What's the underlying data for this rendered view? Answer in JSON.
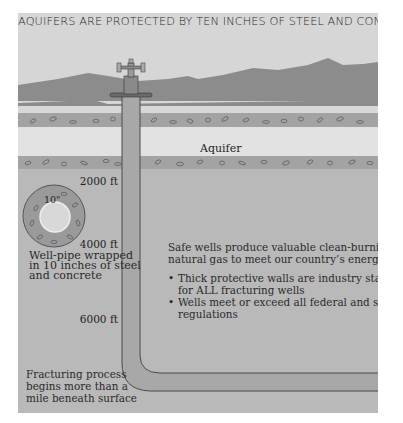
{
  "title": "AQUIFERS ARE PROTECTED BY TEN INCHES OF STEEL AND CONCRETE",
  "layers": {
    "aquifer_label": "Aquifer"
  },
  "depth_markers": [
    "2000 ft",
    "4000 ft",
    "6000 ft"
  ],
  "cross_section": {
    "thickness_label": "10\"",
    "caption": [
      "Well-pipe wrapped",
      "in 10 inches of steel",
      "and concrete"
    ]
  },
  "main_text": {
    "intro": [
      "Safe wells produce valuable clean-burning",
      "natural gas to meet our country’s energy needs"
    ],
    "bullets": [
      [
        "Thick protective walls are industry standard",
        "for ALL fracturing wells"
      ],
      [
        "Wells meet or exceed all federal and state",
        "regulations"
      ]
    ]
  },
  "footer_note": [
    "Fracturing process",
    "begins more than a",
    "mile beneath surface"
  ],
  "colors": {
    "sky": "#d6d6d6",
    "ridge": "#8c8c8c",
    "light_band": "#dadada",
    "rock_band": "#a3a3a3",
    "aquifer": "#e2e2e2",
    "deep_strata": "#b9b9b9",
    "pipe": "#a8a8a8",
    "pipe_outline": "#4a4a4a"
  }
}
